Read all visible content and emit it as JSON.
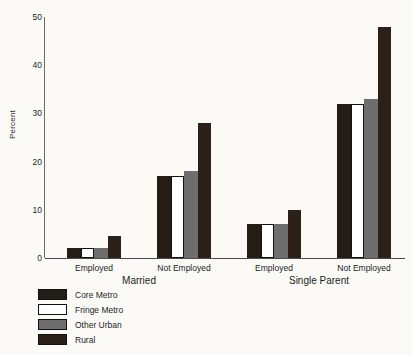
{
  "chart_data": {
    "type": "bar",
    "title": "",
    "xlabel": "",
    "ylabel": "Percent",
    "ylim": [
      0,
      50
    ],
    "yticks": [
      0,
      10,
      20,
      30,
      40,
      50
    ],
    "grid": false,
    "legend_position": "below-left",
    "categories": [
      "Married / Employed",
      "Married / Not Employed",
      "Single Parent / Employed",
      "Single Parent / Not Employed"
    ],
    "category_labels": [
      "Employed",
      "Not Employed",
      "Employed",
      "Not Employed"
    ],
    "group_labels": [
      "Married",
      "Single Parent"
    ],
    "series": [
      {
        "name": "Core Metro",
        "color": "#231d16",
        "values": [
          2,
          17,
          7,
          32
        ]
      },
      {
        "name": "Fringe Metro",
        "color": "#ffffff",
        "values": [
          2,
          17,
          7,
          32
        ]
      },
      {
        "name": "Other Urban",
        "color": "#6e6e6e",
        "values": [
          2,
          18,
          7,
          33
        ]
      },
      {
        "name": "Rural",
        "color": "#2b2119",
        "values": [
          4.5,
          28,
          10,
          48
        ]
      }
    ]
  },
  "axis": {
    "y_label": "Percent",
    "ticks": [
      "0",
      "10",
      "20",
      "30",
      "40",
      "50"
    ]
  },
  "x_axis": {
    "tick_labels": [
      "Employed",
      "Not Employed",
      "Employed",
      "Not Employed"
    ],
    "group_labels": [
      "Married",
      "Single Parent"
    ]
  },
  "legend": {
    "items": [
      {
        "label": "Core Metro",
        "color": "#231d16"
      },
      {
        "label": "Fringe Metro",
        "color": "#ffffff"
      },
      {
        "label": "Other Urban",
        "color": "#6e6e6e"
      },
      {
        "label": "Rural",
        "color": "#2b2119"
      }
    ]
  }
}
